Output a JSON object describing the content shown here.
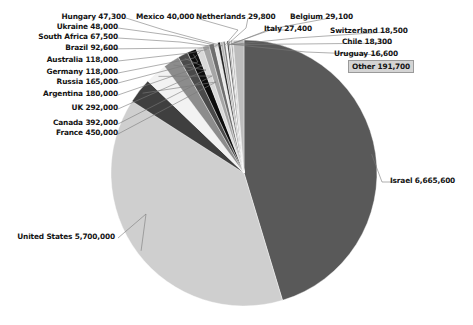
{
  "chart_data": {
    "type": "pie",
    "title": "",
    "unit": "people",
    "total": 14707400,
    "categories": [
      "Israel",
      "United States",
      "France",
      "Canada",
      "UK",
      "Argentina",
      "Russia",
      "Germany",
      "Australia",
      "Brazil",
      "South Africa",
      "Ukraine",
      "Hungary",
      "Mexico",
      "Netherlands",
      "Belgium",
      "Italy",
      "Switzerland",
      "Chile",
      "Uruguay",
      "Other"
    ],
    "values": [
      6665600,
      5700000,
      450000,
      392000,
      292000,
      180000,
      165000,
      118000,
      118000,
      92600,
      67500,
      48000,
      47300,
      40000,
      29800,
      29100,
      27400,
      18500,
      18300,
      16600,
      191700
    ],
    "value_labels": [
      "6,665,600",
      "5,700,000",
      "450,000",
      "392,000",
      "292,000",
      "180,000",
      "165,000",
      "118,000",
      "118,000",
      "92,600",
      "67,500",
      "48,000",
      "47,300",
      "40,000",
      "29,800",
      "29,100",
      "27,400",
      "18,500",
      "18,300",
      "16,600",
      "191,700"
    ],
    "colors": [
      "#595959",
      "#cfcfcf",
      "#3f3f3f",
      "#f2f2f2",
      "#8c8c8c",
      "#4a4a4a",
      "#0d0d0d",
      "#d9d9d9",
      "#a6a6a6",
      "#6e6e6e",
      "#e8e8e8",
      "#1f1f1f",
      "#b5b5b5",
      "#7f7f7f",
      "#f5f5f5",
      "#2b2b2b",
      "#9c9c9c",
      "#e0e0e0",
      "#555555",
      "#c2c2c2",
      "#bdbdbd"
    ],
    "legend": "none",
    "grid": false,
    "labels": [
      {
        "name": "Hungary",
        "value": "47,300",
        "text": "Hungary 47,300",
        "side": "left",
        "boxed": false
      },
      {
        "name": "Ukraine",
        "value": "48,000",
        "text": "Ukraine 48,000",
        "side": "left",
        "boxed": false
      },
      {
        "name": "South Africa",
        "value": "67,500",
        "text": "South Africa 67,500",
        "side": "left",
        "boxed": false
      },
      {
        "name": "Brazil",
        "value": "92,600",
        "text": "Brazil 92,600",
        "side": "left",
        "boxed": false
      },
      {
        "name": "Australia",
        "value": "118,000",
        "text": "Australia 118,000",
        "side": "left",
        "boxed": false
      },
      {
        "name": "Germany",
        "value": "118,000",
        "text": "Germany 118,000",
        "side": "left",
        "boxed": false
      },
      {
        "name": "Russia",
        "value": "165,000",
        "text": "Russia 165,000",
        "side": "left",
        "boxed": false
      },
      {
        "name": "Argentina",
        "value": "180,000",
        "text": "Argentina 180,000",
        "side": "left",
        "boxed": false
      },
      {
        "name": "UK",
        "value": "292,000",
        "text": "UK 292,000",
        "side": "left",
        "boxed": false
      },
      {
        "name": "Canada",
        "value": "392,000",
        "text": "Canada 392,000",
        "side": "left",
        "boxed": false
      },
      {
        "name": "France",
        "value": "450,000",
        "text": "France 450,000",
        "side": "left",
        "boxed": false
      },
      {
        "name": "United States",
        "value": "5,700,000",
        "text": "United States 5,700,000",
        "side": "left",
        "boxed": false
      },
      {
        "name": "Mexico",
        "value": "40,000",
        "text": "Mexico 40,000",
        "side": "top",
        "boxed": false
      },
      {
        "name": "Netherlands",
        "value": "29,800",
        "text": "Netherlands 29,800",
        "side": "top",
        "boxed": false
      },
      {
        "name": "Belgium",
        "value": "29,100",
        "text": "Belgium 29,100",
        "side": "top",
        "boxed": false
      },
      {
        "name": "Italy",
        "value": "27,400",
        "text": "Italy 27,400",
        "side": "right",
        "boxed": false
      },
      {
        "name": "Switzerland",
        "value": "18,500",
        "text": "Switzerland 18,500",
        "side": "right",
        "boxed": false
      },
      {
        "name": "Chile",
        "value": "18,300",
        "text": "Chile 18,300",
        "side": "right",
        "boxed": false
      },
      {
        "name": "Uruguay",
        "value": "16,600",
        "text": "Uruguay 16,600",
        "side": "right",
        "boxed": false
      },
      {
        "name": "Other",
        "value": "191,700",
        "text": "Other 191,700",
        "side": "right",
        "boxed": true
      },
      {
        "name": "Israel",
        "value": "6,665,600",
        "text": "Israel 6,665,600",
        "side": "right",
        "boxed": false
      }
    ]
  },
  "labels": {
    "hungary": "Hungary 47,300",
    "ukraine": "Ukraine 48,000",
    "south_africa": "South Africa 67,500",
    "brazil": "Brazil 92,600",
    "australia": "Australia 118,000",
    "germany": "Germany 118,000",
    "russia": "Russia 165,000",
    "argentina": "Argentina 180,000",
    "uk": "UK 292,000",
    "canada": "Canada 392,000",
    "france": "France 450,000",
    "united_states": "United States 5,700,000",
    "mexico": "Mexico 40,000",
    "netherlands": "Netherlands 29,800",
    "belgium": "Belgium 29,100",
    "italy": "Italy 27,400",
    "switzerland": "Switzerland 18,500",
    "chile": "Chile 18,300",
    "uruguay": "Uruguay 16,600",
    "other": "Other 191,700",
    "israel": "Israel 6,665,600"
  }
}
